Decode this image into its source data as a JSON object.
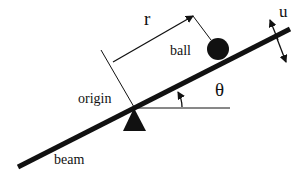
{
  "labels": {
    "r": "r",
    "ball": "ball",
    "u": "u",
    "theta": "θ",
    "origin": "origin",
    "beam": "beam"
  },
  "colors": {
    "ink": "#111111",
    "background": "#ffffff"
  }
}
